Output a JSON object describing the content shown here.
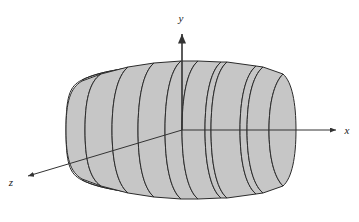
{
  "figure": {
    "name": "solid-of-revolution-barrel-with-cylindrical-slabs",
    "background_color": "#ffffff",
    "slab_fill_color": "#c6c6c6",
    "outline_color": "#2b2b2b",
    "axis_color": "#333333",
    "axes": [
      {
        "id": "y-axis",
        "label": "y",
        "direction": "up",
        "origin": {
          "x": 182,
          "y": 130
        },
        "tip": {
          "x": 182,
          "y": 31
        },
        "arrow": true
      },
      {
        "id": "x-axis",
        "label": "x",
        "direction": "right",
        "origin": {
          "x": 182,
          "y": 130
        },
        "tip": {
          "x": 339,
          "y": 130
        },
        "arrow": true
      },
      {
        "id": "z-axis",
        "label": "z",
        "direction": "lower-left",
        "origin": {
          "x": 182,
          "y": 130
        },
        "tip": {
          "x": 25,
          "y": 177
        },
        "arrow": true
      }
    ],
    "axis_labels": [
      {
        "id": "y-label",
        "text": "y",
        "x": 182,
        "y": 18
      },
      {
        "id": "x-label",
        "text": "x",
        "x": 349,
        "y": 130
      },
      {
        "id": "z-label",
        "text": "z",
        "x": 11,
        "y": 182
      }
    ],
    "barrel": {
      "left_x": 66,
      "right_x": 293,
      "top_y": 62,
      "bottom_y": 198,
      "center_y": 130,
      "max_half_height": 68,
      "end_half_height": 50,
      "ellipse_x_radius": 16
    },
    "slab_boundaries_x": [
      85,
      112,
      138,
      165,
      182,
      205,
      211,
      240,
      247,
      285
    ],
    "slab_count": 9
  }
}
